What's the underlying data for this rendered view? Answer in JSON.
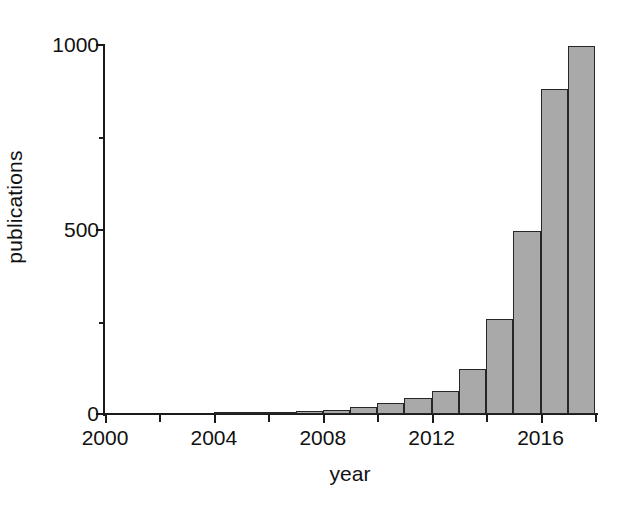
{
  "chart_data": {
    "type": "bar",
    "title": "",
    "xlabel": "year",
    "ylabel": "publications",
    "categories": [
      2000,
      2001,
      2002,
      2003,
      2004,
      2005,
      2006,
      2007,
      2008,
      2009,
      2010,
      2011,
      2012,
      2013,
      2014,
      2015,
      2016,
      2017
    ],
    "values": [
      0,
      0,
      0,
      0,
      2,
      4,
      6,
      7,
      10,
      18,
      30,
      43,
      62,
      122,
      258,
      495,
      880,
      998
    ],
    "xlim": [
      2000,
      2018
    ],
    "ylim": [
      0,
      1000
    ],
    "x_tick_labels": [
      "2000",
      "2004",
      "2008",
      "2012",
      "2016"
    ],
    "x_tick_values": [
      2000,
      2004,
      2008,
      2012,
      2016
    ],
    "x_minor_tick_values": [
      2002,
      2006,
      2010,
      2014,
      2018
    ],
    "y_tick_labels": [
      "0",
      "500",
      "1000"
    ],
    "y_tick_values": [
      0,
      500,
      1000
    ],
    "y_minor_tick_values": [
      250,
      750
    ],
    "grid": false,
    "legend": null,
    "bar_fill_color": "#a9a9a9",
    "bar_edge_color": "#262626",
    "axis_color": "#1b1b1b",
    "background_color": "#ffffff"
  }
}
